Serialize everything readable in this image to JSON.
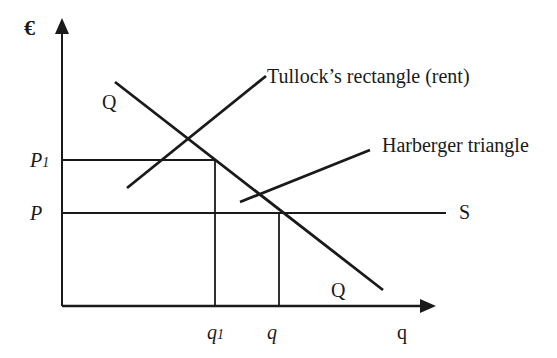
{
  "diagram": {
    "type": "economics-supply-demand",
    "y_axis_label": "€",
    "x_axis_label": "q",
    "demand_label_top": "Q",
    "demand_label_bottom": "Q",
    "supply_label": "S",
    "price_labels": {
      "p1": "P",
      "p1_sub": "1",
      "p": "P"
    },
    "quantity_labels": {
      "q1": "q",
      "q1_sub": "1",
      "q": "q"
    },
    "annotations": {
      "tullock": "Tullock’s rectangle (rent)",
      "harberger": "Harberger triangle"
    },
    "colors": {
      "line": "#1a1a1a",
      "background": "#ffffff"
    }
  }
}
